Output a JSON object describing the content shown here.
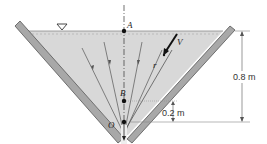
{
  "diagram": {
    "type": "conical funnel flow (sink flow)",
    "points": {
      "A": "A",
      "B": "B",
      "O": "O"
    },
    "vectors": {
      "velocity": "V",
      "radius": "r"
    },
    "dimensions": {
      "total_height": "0.8 m",
      "point_B_height": "0.2 m"
    },
    "symbols": {
      "free_surface": "free-surface-triangle"
    },
    "colors": {
      "fluid": "#d6d6d6",
      "wall": "#a9a9a9",
      "wall_edge": "#555555",
      "line": "#444444"
    }
  }
}
